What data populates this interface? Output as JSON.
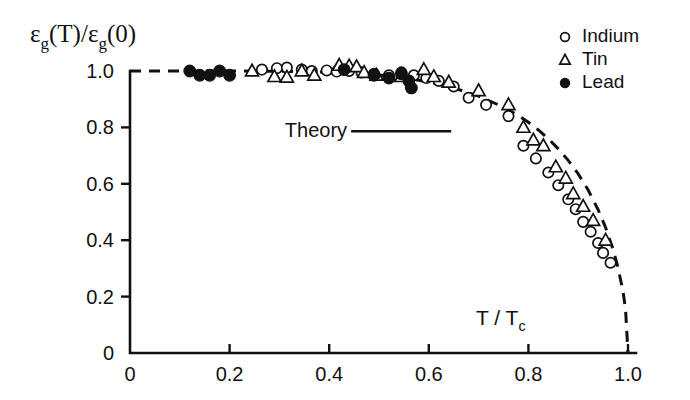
{
  "chart_data": {
    "type": "scatter",
    "title": "",
    "xlabel": "T / Tc",
    "ylabel": "εg(T)/εg(0)",
    "xlim": [
      0,
      1.05
    ],
    "ylim": [
      0,
      1.08
    ],
    "grid": false,
    "legend_position": "top-right",
    "xticks": [
      0,
      0.2,
      0.4,
      0.6,
      0.8,
      1.0
    ],
    "xticklabels": [
      "0",
      "0.2",
      "0.4",
      "0.6",
      "0.8",
      "1.0"
    ],
    "yticks": [
      0,
      0.2,
      0.4,
      0.6,
      0.8,
      1.0
    ],
    "yticklabels": [
      "0",
      "0.2",
      "0.4",
      "0.6",
      "0.8",
      "1.0"
    ],
    "annotations": [
      {
        "text": "Theory",
        "x": 0.44,
        "y": 0.79,
        "leader_to_x": 0.645,
        "leader_to_y": 0.79
      }
    ],
    "series": [
      {
        "name": "Indium",
        "marker": "open-circle",
        "points": [
          [
            0.265,
            1.005
          ],
          [
            0.295,
            1.01
          ],
          [
            0.315,
            1.012
          ],
          [
            0.345,
            1.005
          ],
          [
            0.365,
            1.0
          ],
          [
            0.395,
            1.002
          ],
          [
            0.415,
            0.998
          ],
          [
            0.44,
            1.0
          ],
          [
            0.465,
            0.995
          ],
          [
            0.49,
            0.99
          ],
          [
            0.52,
            0.985
          ],
          [
            0.545,
            0.995
          ],
          [
            0.57,
            0.985
          ],
          [
            0.595,
            0.975
          ],
          [
            0.62,
            0.965
          ],
          [
            0.65,
            0.945
          ],
          [
            0.68,
            0.905
          ],
          [
            0.715,
            0.88
          ],
          [
            0.76,
            0.84
          ],
          [
            0.79,
            0.735
          ],
          [
            0.815,
            0.69
          ],
          [
            0.84,
            0.64
          ],
          [
            0.86,
            0.595
          ],
          [
            0.88,
            0.545
          ],
          [
            0.895,
            0.51
          ],
          [
            0.91,
            0.465
          ],
          [
            0.925,
            0.43
          ],
          [
            0.94,
            0.39
          ],
          [
            0.95,
            0.355
          ],
          [
            0.965,
            0.32
          ]
        ]
      },
      {
        "name": "Tin",
        "marker": "open-triangle",
        "points": [
          [
            0.245,
            1.0
          ],
          [
            0.29,
            0.98
          ],
          [
            0.315,
            0.978
          ],
          [
            0.345,
            1.0
          ],
          [
            0.37,
            0.985
          ],
          [
            0.42,
            1.02
          ],
          [
            0.44,
            1.018
          ],
          [
            0.455,
            1.015
          ],
          [
            0.47,
            0.995
          ],
          [
            0.495,
            0.985
          ],
          [
            0.545,
            0.98
          ],
          [
            0.59,
            1.005
          ],
          [
            0.61,
            0.98
          ],
          [
            0.64,
            0.96
          ],
          [
            0.7,
            0.93
          ],
          [
            0.76,
            0.88
          ],
          [
            0.79,
            0.8
          ],
          [
            0.81,
            0.755
          ],
          [
            0.83,
            0.735
          ],
          [
            0.855,
            0.66
          ],
          [
            0.875,
            0.62
          ],
          [
            0.89,
            0.565
          ],
          [
            0.91,
            0.52
          ],
          [
            0.93,
            0.47
          ],
          [
            0.955,
            0.4
          ]
        ]
      },
      {
        "name": "Lead",
        "marker": "filled-circle",
        "points": [
          [
            0.12,
            1.0
          ],
          [
            0.14,
            0.985
          ],
          [
            0.16,
            0.985
          ],
          [
            0.18,
            1.0
          ],
          [
            0.2,
            0.985
          ],
          [
            0.43,
            1.005
          ],
          [
            0.49,
            0.985
          ],
          [
            0.52,
            0.975
          ],
          [
            0.545,
            0.99
          ],
          [
            0.56,
            0.965
          ],
          [
            0.565,
            0.94
          ]
        ]
      }
    ],
    "theory_curve": {
      "name": "Theory",
      "style": "dashed",
      "points": [
        [
          0.0,
          1.0
        ],
        [
          0.1,
          1.0
        ],
        [
          0.2,
          1.0
        ],
        [
          0.3,
          0.999
        ],
        [
          0.4,
          0.996
        ],
        [
          0.45,
          0.992
        ],
        [
          0.5,
          0.986
        ],
        [
          0.55,
          0.976
        ],
        [
          0.6,
          0.961
        ],
        [
          0.65,
          0.94
        ],
        [
          0.7,
          0.911
        ],
        [
          0.75,
          0.872
        ],
        [
          0.78,
          0.842
        ],
        [
          0.8,
          0.818
        ],
        [
          0.82,
          0.791
        ],
        [
          0.84,
          0.76
        ],
        [
          0.86,
          0.724
        ],
        [
          0.88,
          0.683
        ],
        [
          0.9,
          0.635
        ],
        [
          0.92,
          0.578
        ],
        [
          0.94,
          0.508
        ],
        [
          0.955,
          0.445
        ],
        [
          0.97,
          0.367
        ],
        [
          0.98,
          0.303
        ],
        [
          0.99,
          0.218
        ],
        [
          0.995,
          0.157
        ],
        [
          1.0,
          0.0
        ]
      ]
    }
  },
  "legend": {
    "entries": [
      {
        "label": "Indium",
        "marker": "open-circle"
      },
      {
        "label": "Tin",
        "marker": "open-triangle"
      },
      {
        "label": "Lead",
        "marker": "filled-circle"
      }
    ]
  },
  "labels": {
    "y_axis_main": "ε",
    "y_axis_sub": "g",
    "y_axis_rest1": "(T)/",
    "y_axis_main2": "ε",
    "y_axis_sub2": "g",
    "y_axis_rest2": "(0)",
    "x_axis_main": "T / T",
    "x_axis_sub": "c",
    "theory": "Theory"
  }
}
